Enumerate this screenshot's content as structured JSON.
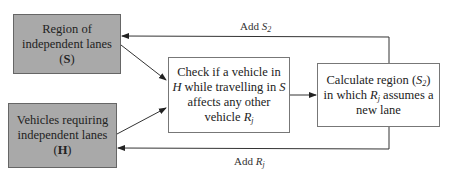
{
  "diagram": {
    "nodes": [
      {
        "id": "S",
        "lines": [
          "Region of",
          "independent lanes"
        ],
        "symbol": "S",
        "fill": "#a9a9a9"
      },
      {
        "id": "H",
        "lines": [
          "Vehicles requiring",
          "independent lanes"
        ],
        "symbol": "H",
        "fill": "#a9a9a9"
      },
      {
        "id": "check",
        "text": {
          "l1": "Check if a vehicle in",
          "l2_var": "H",
          "l2_mid": " while travelling in ",
          "l2_var2": "S",
          "l3": "affects any other",
          "l4_pre": "vehicle ",
          "l4_var": "R",
          "l4_sub": "j"
        },
        "fill": "#ffffff"
      },
      {
        "id": "calc",
        "text": {
          "l1_pre": "Calculate region (",
          "l1_var": "S",
          "l1_sub": "2",
          "l1_post": ")",
          "l2_pre": "in which ",
          "l2_var": "R",
          "l2_sub": "j",
          "l2_post": " assumes a",
          "l3": "new lane"
        },
        "fill": "#ffffff"
      }
    ],
    "edges": [
      {
        "from": "S",
        "to": "check"
      },
      {
        "from": "H",
        "to": "check"
      },
      {
        "from": "check",
        "to": "calc"
      },
      {
        "from": "calc",
        "to": "S",
        "label": {
          "pre": "Add ",
          "var": "S",
          "sub": "2"
        }
      },
      {
        "from": "calc",
        "to": "H",
        "label": {
          "pre": "Add ",
          "var": "R",
          "sub": "j"
        }
      }
    ]
  }
}
